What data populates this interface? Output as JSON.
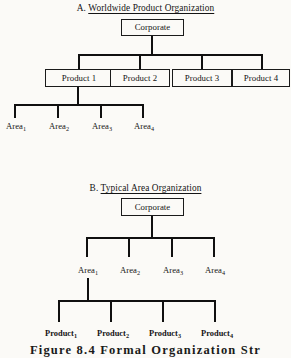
{
  "figure": {
    "caption": "Figure 8.4    Formal Organization Str",
    "background_color": "#fbfaf7",
    "line_color": "#101010",
    "text_color": "#141414"
  },
  "panel_a": {
    "label": "A.",
    "title": "Worldwide Product Organization",
    "root": {
      "label": "Corporate"
    },
    "products": [
      {
        "label": "Product 1"
      },
      {
        "label": "Product 2"
      },
      {
        "label": "Product 3"
      },
      {
        "label": "Product 4"
      }
    ],
    "areas": [
      {
        "name": "Area",
        "subscript": "1"
      },
      {
        "name": "Area",
        "subscript": "2"
      },
      {
        "name": "Area",
        "subscript": "3"
      },
      {
        "name": "Area",
        "subscript": "4"
      }
    ]
  },
  "panel_b": {
    "label": "B.",
    "title": "Typical Area Organization",
    "root": {
      "label": "Corporate"
    },
    "areas": [
      {
        "name": "Area",
        "subscript": "1"
      },
      {
        "name": "Area",
        "subscript": "2"
      },
      {
        "name": "Area",
        "subscript": "3"
      },
      {
        "name": "Area",
        "subscript": "4"
      }
    ],
    "products": [
      {
        "name": "Product",
        "subscript": "1"
      },
      {
        "name": "Product",
        "subscript": "2"
      },
      {
        "name": "Product",
        "subscript": "3"
      },
      {
        "name": "Product",
        "subscript": "4"
      }
    ]
  }
}
